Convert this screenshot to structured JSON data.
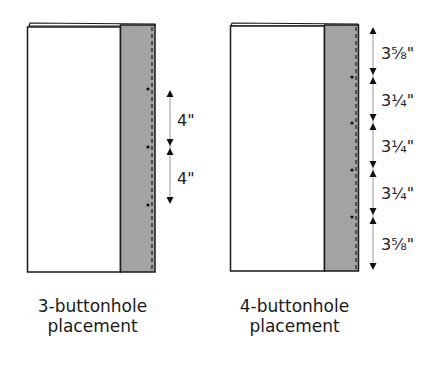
{
  "colors": {
    "outline": "#1a1a1a",
    "band_fill": "#a3a3a3",
    "arrow": "#999999",
    "arrowhead": "#111111",
    "panel": "#ffffff"
  },
  "diagrams": [
    {
      "caption_line1": "3-buttonhole",
      "caption_line2": "placement",
      "buttonhole_count": 3,
      "dimensions": [
        "4\"",
        "4\""
      ]
    },
    {
      "caption_line1": "4-buttonhole",
      "caption_line2": "placement",
      "buttonhole_count": 4,
      "dimensions": [
        "3⅝\"",
        "3¼\"",
        "3¼\"",
        "3¼\"",
        "3⅝\""
      ]
    }
  ]
}
